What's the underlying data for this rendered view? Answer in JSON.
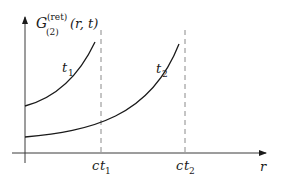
{
  "figure": {
    "y_axis_label": {
      "main": "G",
      "superscript": "(ret)",
      "subscript": "(2)",
      "args": "(r, t)"
    },
    "x_axis_label": "r",
    "ticks": [
      {
        "prefix": "c",
        "var": "t",
        "sub": "1"
      },
      {
        "prefix": "c",
        "var": "t",
        "sub": "2"
      }
    ],
    "curves": [
      {
        "name": "t",
        "sub": "1"
      },
      {
        "name": "t",
        "sub": "2"
      }
    ],
    "colors": {
      "curve": "#1a1a1a",
      "axis": "#3a3a3a",
      "dashed": "#8a8a8a"
    }
  }
}
